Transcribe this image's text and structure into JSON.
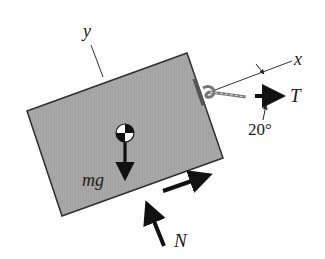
{
  "figure": {
    "type": "free-body-diagram",
    "colors": {
      "block_fill": "#a8a8a8",
      "block_edge": "#3a3a3a",
      "arrow": "#111111",
      "axis_line": "#333333",
      "background": "#ffffff"
    },
    "labels": {
      "y_axis": "y",
      "x_axis": "x",
      "tension": "T",
      "angle": "20°",
      "weight": "mg",
      "normal": "N"
    }
  }
}
